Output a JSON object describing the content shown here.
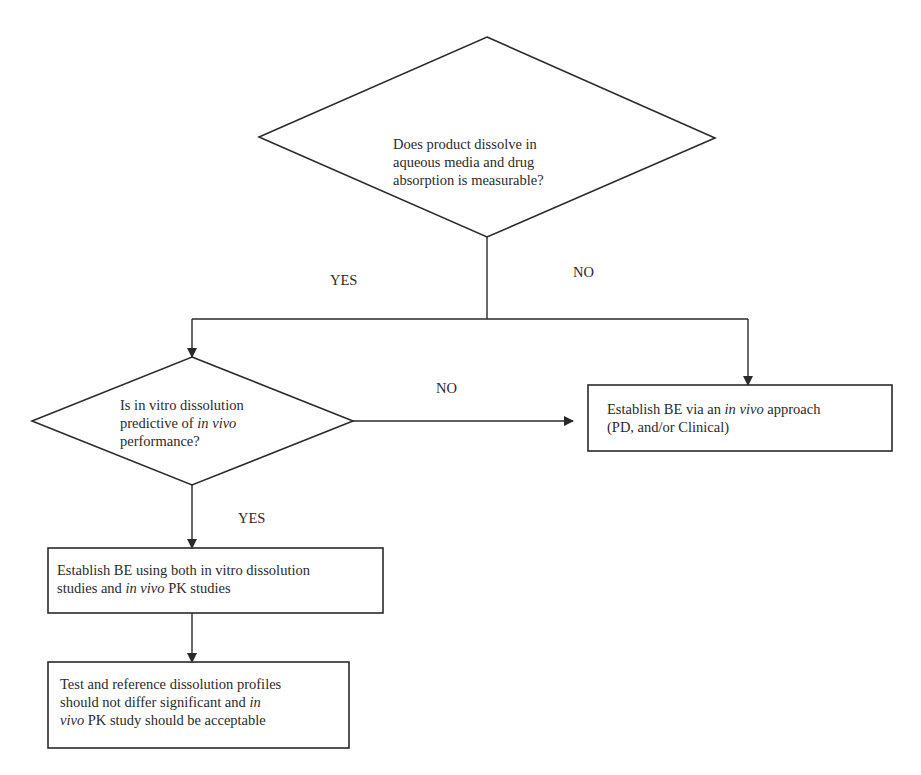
{
  "diagram": {
    "type": "flowchart",
    "nodes": [
      {
        "id": "q1",
        "shape": "diamond",
        "lines": [
          "Does product dissolve in",
          "aqueous media and drug",
          "absorption is measurable?"
        ]
      },
      {
        "id": "q2",
        "shape": "diamond",
        "lines": [
          [
            {
              "t": "Is in vitro dissolution"
            }
          ],
          [
            {
              "t": "predictive of "
            },
            {
              "t": "in vivo",
              "italic": true
            }
          ],
          [
            {
              "t": "performance?"
            }
          ]
        ]
      },
      {
        "id": "r1",
        "shape": "rectangle",
        "lines": [
          [
            {
              "t": "Establish BE via an "
            },
            {
              "t": "in vivo",
              "italic": true
            },
            {
              "t": " approach"
            }
          ],
          [
            {
              "t": "(PD, and/or Clinical)"
            }
          ]
        ]
      },
      {
        "id": "r2",
        "shape": "rectangle",
        "lines": [
          [
            {
              "t": "Establish BE using both in vitro dissolution"
            }
          ],
          [
            {
              "t": "studies and "
            },
            {
              "t": "in vivo",
              "italic": true
            },
            {
              "t": " PK studies"
            }
          ]
        ]
      },
      {
        "id": "r3",
        "shape": "rectangle",
        "lines": [
          [
            {
              "t": "Test and reference dissolution profiles"
            }
          ],
          [
            {
              "t": "should not differ significant and "
            },
            {
              "t": "in",
              "italic": true
            }
          ],
          [
            {
              "t": "vivo",
              "italic": true
            },
            {
              "t": " PK study should be acceptable"
            }
          ]
        ]
      }
    ],
    "edges": [
      {
        "from": "q1",
        "to": "q2",
        "label": "YES"
      },
      {
        "from": "q1",
        "to": "r1",
        "label": "NO"
      },
      {
        "from": "q2",
        "to": "r1",
        "label": "NO"
      },
      {
        "from": "q2",
        "to": "r2",
        "label": "YES"
      },
      {
        "from": "r2",
        "to": "r3",
        "label": ""
      }
    ],
    "labels": {
      "q1_yes": "YES",
      "q1_no": "NO",
      "q2_no": "NO",
      "q2_yes": "YES"
    },
    "q1_text": {
      "line1": "Does product dissolve in",
      "line2": "aqueous media and drug",
      "line3": "absorption is measurable?"
    },
    "q2_text": {
      "line1": "Is in vitro dissolution",
      "line2_a": "predictive of ",
      "line2_b": "in vivo",
      "line3": "performance?"
    },
    "r1_text": {
      "line1_a": "Establish BE via an ",
      "line1_b": "in vivo",
      "line1_c": " approach",
      "line2": "(PD, and/or Clinical)"
    },
    "r2_text": {
      "line1": "Establish BE using both in vitro dissolution",
      "line2_a": "studies and ",
      "line2_b": "in vivo",
      "line2_c": " PK studies"
    },
    "r3_text": {
      "line1": "Test and reference dissolution profiles",
      "line2_a": "should not differ significant and ",
      "line2_b": "in",
      "line3_a": "vivo",
      "line3_b": " PK study should be acceptable"
    },
    "colors": {
      "stroke": "#2a2a2a",
      "background": "#ffffff"
    }
  }
}
